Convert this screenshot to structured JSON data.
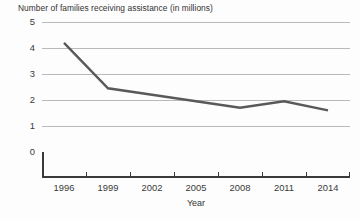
{
  "chart_data": {
    "type": "line",
    "title": "Number of families receiving assistance (in millions)",
    "xlabel": "Year",
    "ylabel": "",
    "categories": [
      "1996",
      "1999",
      "2002",
      "2005",
      "2008",
      "2011",
      "2014"
    ],
    "x": [
      1996,
      1999,
      2002,
      2005,
      2008,
      2011,
      2014
    ],
    "values": [
      4.2,
      2.45,
      2.2,
      1.95,
      1.7,
      1.95,
      1.6
    ],
    "series": [
      {
        "name": "Number of families receiving assistance (in millions)",
        "values": [
          4.2,
          2.45,
          2.2,
          1.95,
          1.7,
          1.95,
          1.6
        ]
      }
    ],
    "ylim": [
      0,
      5
    ],
    "ytick_labels": [
      "0",
      "1",
      "2",
      "3",
      "4",
      "5"
    ],
    "ytick_values": [
      0,
      1,
      2,
      3,
      4,
      5
    ],
    "grid": true,
    "legend": "none",
    "line_color": "#595959",
    "grid_color": "#b9b9b9",
    "axis_color": "#3a3a3a",
    "background_color": "#fdfdfd"
  }
}
